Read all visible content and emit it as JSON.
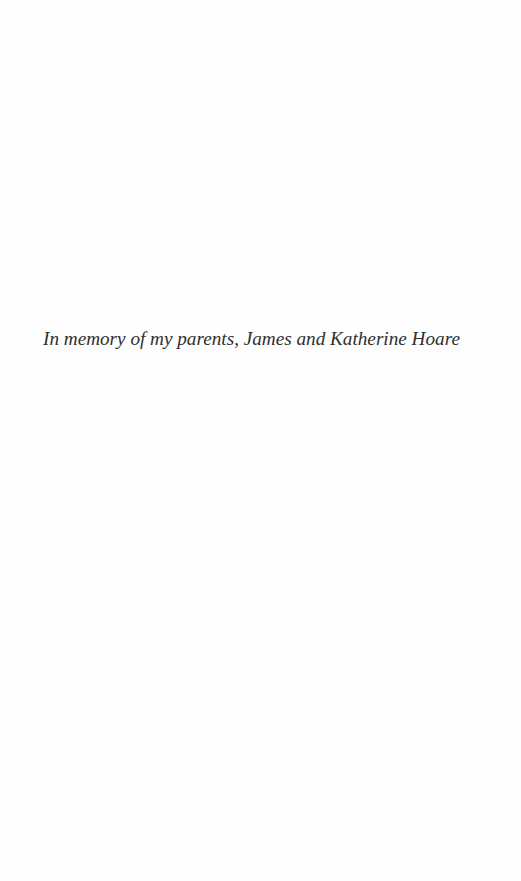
{
  "page": {
    "type": "dedication",
    "dedication_text": "In memory of my parents, James and Katherine Hoare"
  }
}
